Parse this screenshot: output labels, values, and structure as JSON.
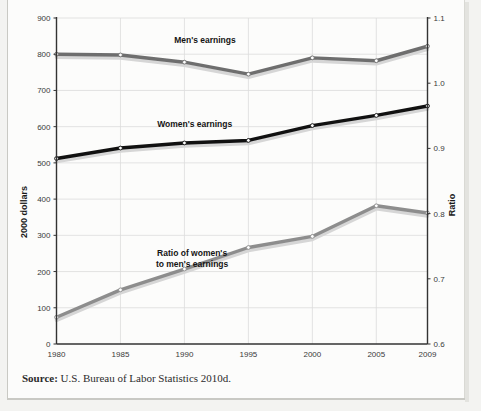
{
  "figure": {
    "source_prefix": "Source:",
    "source_text": "U.S. Bureau of Labor Statistics 2010d."
  },
  "colors": {
    "mens_line": "#6e6e6e",
    "womens_line": "#111111",
    "ratio_line": "#8d8d8d",
    "gridline": "#dcdcdc",
    "axis": "#333333",
    "shadow": "#d6d6d6",
    "marker_fill": "#ffffff",
    "page_background": "#fcfcfb",
    "outer_background": "#f3f3f1"
  },
  "chart_data": {
    "type": "line",
    "title": "",
    "xlabel": "",
    "ylabel": "2000 dollars",
    "y2label": "Ratio",
    "grid": true,
    "legend_position": "inline-labels",
    "x": [
      1980,
      1985,
      1990,
      1995,
      2000,
      2005,
      2009
    ],
    "categories": [
      "1980",
      "1985",
      "1990",
      "1995",
      "2000",
      "2005",
      "2009"
    ],
    "xticklabels": [
      "1980",
      "1985",
      "1990",
      "1995",
      "2000",
      "2005",
      "2009"
    ],
    "ylim": [
      0,
      900
    ],
    "yticks": [
      0,
      100,
      200,
      300,
      400,
      500,
      600,
      700,
      800,
      900
    ],
    "yticklabels": [
      "0",
      "100",
      "200",
      "300",
      "400",
      "500",
      "600",
      "700",
      "800",
      "900"
    ],
    "y2lim": [
      0.6,
      1.1
    ],
    "y2ticks": [
      0.6,
      0.7,
      0.8,
      0.9,
      1.0,
      1.1
    ],
    "y2ticklabels": [
      "0.6",
      "0.7",
      "0.8",
      "0.9",
      "1.0",
      "1.1"
    ],
    "series": [
      {
        "name": "Men's earnings",
        "axis": "left",
        "color": "#6e6e6e",
        "values": [
          800,
          798,
          778,
          745,
          790,
          782,
          822
        ],
        "label_text": "Men's earnings",
        "label_x": 1991.6,
        "label_y": 830
      },
      {
        "name": "Women's earnings",
        "axis": "left",
        "color": "#111111",
        "values": [
          512,
          541,
          555,
          562,
          603,
          631,
          657
        ],
        "label_text": "Women's earnings",
        "label_x": 1990.8,
        "label_y": 600
      },
      {
        "name": "Ratio of women's to men's earnings",
        "axis": "right",
        "color": "#8d8d8d",
        "values": [
          0.641,
          0.683,
          0.715,
          0.748,
          0.765,
          0.812,
          0.801
        ],
        "label_text_line1": "Ratio of women's",
        "label_text_line2": "to men's earnings",
        "label_x": 1990.6,
        "label_y": 0.735
      }
    ]
  }
}
